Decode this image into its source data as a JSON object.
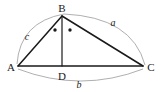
{
  "figure": {
    "type": "geometry-diagram",
    "vertices": [
      {
        "id": "A",
        "label": "A",
        "x": 18,
        "y": 66,
        "label_x": 11,
        "label_y": 70
      },
      {
        "id": "B",
        "label": "B",
        "x": 62,
        "y": 16,
        "label_x": 58,
        "label_y": 12
      },
      {
        "id": "C",
        "label": "C",
        "x": 143,
        "y": 66,
        "label_x": 150,
        "label_y": 70
      },
      {
        "id": "D",
        "label": "D",
        "x": 62,
        "y": 66,
        "label_x": 58,
        "label_y": 80
      }
    ],
    "segments": [
      {
        "id": "AB",
        "from": "A",
        "to": "B",
        "style": "solid"
      },
      {
        "id": "BC",
        "from": "B",
        "to": "C",
        "style": "solid"
      },
      {
        "id": "AC",
        "from": "A",
        "to": "C",
        "style": "solid"
      },
      {
        "id": "BD",
        "from": "B",
        "to": "D",
        "style": "solid"
      }
    ],
    "side_labels": [
      {
        "id": "a",
        "label": "a",
        "side": "BC",
        "x": 113,
        "y": 25
      },
      {
        "id": "b",
        "label": "b",
        "side": "AC",
        "x": 79,
        "y": 87
      },
      {
        "id": "c",
        "label": "c",
        "side": "AB",
        "x": 27,
        "y": 39
      }
    ],
    "arcs": [
      {
        "id": "arc-c",
        "from": "A",
        "to": "B",
        "path": "M 17 64 Q 20 22 64 14"
      },
      {
        "id": "arc-a",
        "from": "B",
        "to": "C",
        "path": "M 64 14 Q 132 17 145 65"
      },
      {
        "id": "arc-b",
        "from": "A",
        "to": "C",
        "path": "M 18 69 Q 81 93 143 69"
      }
    ],
    "angle_marks": [
      {
        "id": "angle-dot-left",
        "x": 55,
        "y": 30,
        "r": 1.7
      },
      {
        "id": "angle-dot-right",
        "x": 70,
        "y": 30,
        "r": 1.7
      }
    ],
    "colors": {
      "line": "#1a1a1a",
      "arc": "#9a9a9a",
      "background": "#ffffff",
      "text": "#1a1a1a"
    }
  }
}
